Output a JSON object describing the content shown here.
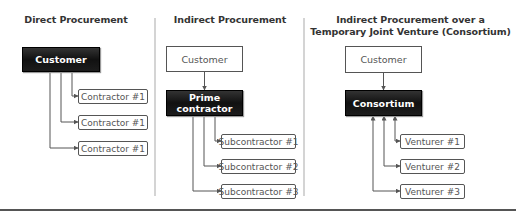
{
  "panels": [
    {
      "title": "Direct Procurement",
      "top_box": "Customer",
      "children": [
        "Contractor #1",
        "Contractor #1",
        "Contractor #1"
      ]
    },
    {
      "title": "Indirect Procurement",
      "top_box": "Customer",
      "middle_box": "Prime contractor",
      "middle_box_lines": [
        "Prime",
        "contractor"
      ],
      "children": [
        "Subcontractor #1",
        "Subcontractor #2",
        "Subcontractor #3"
      ]
    },
    {
      "title_lines": [
        "Indirect Procurement over a",
        "Temporary Joint Venture (Consortium)"
      ],
      "top_box": "Customer",
      "middle_box": "Consortium",
      "children": [
        "Venturer #1",
        "Venturer #2",
        "Venturer #3"
      ]
    }
  ],
  "colors": {
    "dark_box": "#111111",
    "line": "#555555",
    "divider": "#d4d4d4",
    "rule": "#555555"
  }
}
